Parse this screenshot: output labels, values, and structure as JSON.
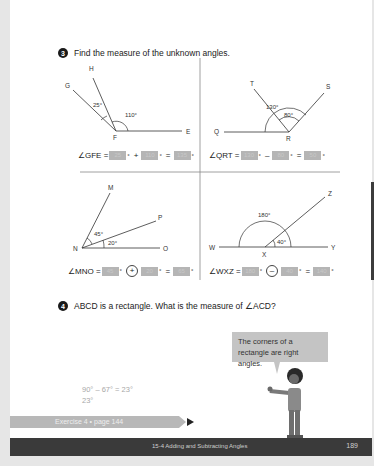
{
  "question3": {
    "number": "3",
    "prompt": "Find the measure of the unknown angles.",
    "diagrams": {
      "gfe": {
        "points": {
          "H": "H",
          "G": "G",
          "F": "F",
          "E": "E"
        },
        "angles": {
          "a1": "25°",
          "a2": "110°"
        },
        "equation": {
          "label": "∠GFE =",
          "box1": "25",
          "op": "+",
          "box2": "110",
          "eq": "=",
          "box3": "135",
          "deg": "°"
        }
      },
      "qrt": {
        "points": {
          "T": "T",
          "S": "S",
          "Q": "Q",
          "R": "R"
        },
        "angles": {
          "a1": "130°",
          "a2": "80°"
        },
        "equation": {
          "label": "∠QRT =",
          "box1": "130",
          "op": "–",
          "box2": "80",
          "eq": "=",
          "box3": "50",
          "deg": "°"
        }
      },
      "mno": {
        "points": {
          "M": "M",
          "P": "P",
          "N": "N",
          "O": "O"
        },
        "angles": {
          "a1": "45°",
          "a2": "20°"
        },
        "equation": {
          "label": "∠MNO =",
          "box1": "45",
          "op": "+",
          "box2": "20",
          "eq": "=",
          "box3": "65",
          "deg": "°"
        }
      },
      "wxz": {
        "points": {
          "Z": "Z",
          "W": "W",
          "X": "X",
          "Y": "Y"
        },
        "angles": {
          "a1": "180°",
          "a2": "40°"
        },
        "equation": {
          "label": "∠WXZ =",
          "box1": "180",
          "op": "–",
          "box2": "40",
          "eq": "=",
          "box3": "140",
          "deg": "°"
        }
      }
    }
  },
  "question4": {
    "number": "4",
    "prompt": "ABCD is a rectangle. What is the measure of ∠ACD?",
    "points": {
      "A": "A",
      "B": "B",
      "C": "C",
      "D": "D"
    },
    "angle_given": "67°",
    "angle_unknown": "?",
    "work_line1": "90° – 67° = 23°",
    "work_line2": "23°",
    "speech_bubble": "The corners of a rectangle are right angles."
  },
  "exercise_link": "Exercise 4 • page 144",
  "footer": {
    "chapter": "15-4 Adding and Subtracting Angles",
    "page_number": "189"
  }
}
